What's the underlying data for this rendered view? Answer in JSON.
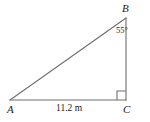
{
  "figure": {
    "kind": "right-triangle-diagram",
    "stroke_color": "#6e6e6e",
    "text_color": "#1a1a1a",
    "background_color": "#ffffff",
    "vertices": {
      "a": {
        "label": "A",
        "x": 10,
        "y": 100
      },
      "b": {
        "label": "B",
        "x": 126,
        "y": 18
      },
      "c": {
        "label": "C",
        "x": 126,
        "y": 100
      }
    },
    "angles": {
      "at_b": {
        "label": "55°",
        "value": 55,
        "unit": "degrees"
      },
      "at_c": {
        "label": "",
        "value": 90,
        "unit": "degrees",
        "marker": "right-angle-square"
      }
    },
    "sides": {
      "ac": {
        "label": "11.2 m",
        "value": 11.2,
        "unit": "m"
      },
      "bc": {
        "label": ""
      },
      "ab": {
        "label": ""
      }
    },
    "icons": {
      "right_angle": "right-angle-icon"
    }
  }
}
